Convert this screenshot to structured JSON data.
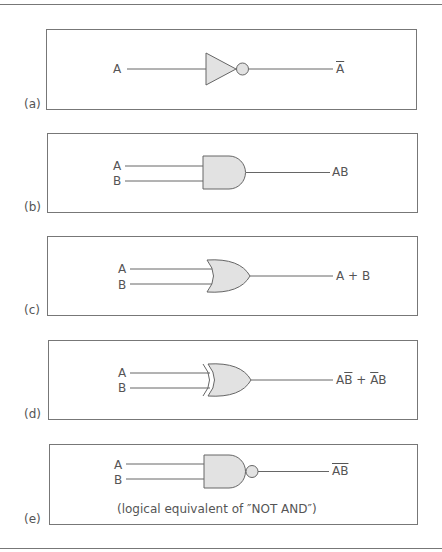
{
  "figure": {
    "panels": [
      {
        "id": "a",
        "label": "(a)",
        "gate": "NOT",
        "inputs": [
          "A"
        ],
        "output": {
          "text": "A",
          "overline": true
        }
      },
      {
        "id": "b",
        "label": "(b)",
        "gate": "AND",
        "inputs": [
          "A",
          "B"
        ],
        "output": {
          "text": "AB",
          "overline": false
        }
      },
      {
        "id": "c",
        "label": "(c)",
        "gate": "OR",
        "inputs": [
          "A",
          "B"
        ],
        "output": {
          "text": "A + B",
          "overline": false
        }
      },
      {
        "id": "d",
        "label": "(d)",
        "gate": "XOR",
        "inputs": [
          "A",
          "B"
        ],
        "output": {
          "parts": [
            "A",
            "B",
            " + ",
            "A",
            "B"
          ],
          "display": "AB̄ + ĀB"
        }
      },
      {
        "id": "e",
        "label": "(e)",
        "gate": "NAND",
        "inputs": [
          "A",
          "B"
        ],
        "output": {
          "text": "AB",
          "overline": true
        },
        "caption": "(logical equivalent of ″NOT AND″)"
      }
    ],
    "colors": {
      "gate_fill": "#e2e2e2",
      "stroke": "#666666",
      "text": "#555555"
    }
  }
}
